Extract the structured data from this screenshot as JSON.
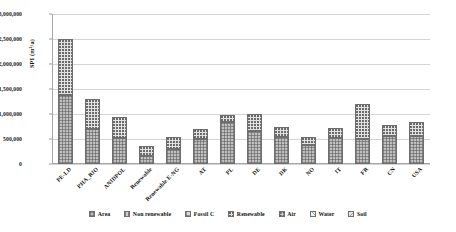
{
  "chart_data": {
    "type": "bar",
    "subtype": "stacked-column",
    "title": "",
    "xlabel": "",
    "ylabel": "SPI (m²/a)",
    "ylim": [
      0,
      3000000
    ],
    "ytick_step": 500000,
    "ytick_labels": [
      "3,000,000",
      "2,500,000",
      "2,000,000",
      "1,500,000",
      "1,000,000",
      "500,000",
      "0"
    ],
    "ytick_values": [
      3000000,
      2500000,
      2000000,
      1500000,
      1000000,
      500000,
      0
    ],
    "grid": "horizontal",
    "legend_position": "bottom",
    "categories": [
      "PE-LD",
      "PHA_RIO",
      "ANIDPOL",
      "Renewable",
      "Renewable E-NG",
      "AT",
      "PL",
      "DE",
      "DK",
      "NO",
      "IT",
      "FR",
      "CN",
      "USA"
    ],
    "series": [
      {
        "name": "Area",
        "pattern": "p-area",
        "color": "#bfbfbf",
        "values": [
          1380000,
          700000,
          520000,
          170000,
          300000,
          500000,
          840000,
          660000,
          540000,
          380000,
          520000,
          500000,
          560000,
          570000
        ]
      },
      {
        "name": "Non renewable",
        "pattern": "p-nonren",
        "color": "#cfcfcf",
        "values": [
          0,
          0,
          0,
          0,
          0,
          0,
          0,
          0,
          0,
          0,
          0,
          0,
          0,
          0
        ]
      },
      {
        "name": "Fossil C",
        "pattern": "p-fossil",
        "color": "#d9d9d9",
        "values": [
          0,
          0,
          0,
          0,
          0,
          0,
          0,
          0,
          0,
          0,
          0,
          0,
          0,
          0
        ]
      },
      {
        "name": "Renewable",
        "pattern": "p-renew",
        "color": "#e2e2e2",
        "values": [
          1120000,
          600000,
          430000,
          190000,
          250000,
          210000,
          140000,
          350000,
          200000,
          170000,
          200000,
          700000,
          220000,
          270000
        ]
      },
      {
        "name": "Air",
        "pattern": "p-air",
        "color": "#ededed",
        "values": [
          0,
          0,
          0,
          0,
          0,
          0,
          0,
          0,
          0,
          0,
          0,
          0,
          0,
          0
        ]
      },
      {
        "name": "Water",
        "pattern": "p-water",
        "color": "#f2f2f2",
        "values": [
          0,
          0,
          0,
          0,
          0,
          0,
          0,
          0,
          0,
          0,
          0,
          0,
          0,
          0
        ]
      },
      {
        "name": "Soil",
        "pattern": "p-soil",
        "color": "#e8e8e8",
        "values": [
          0,
          0,
          0,
          0,
          0,
          0,
          0,
          0,
          0,
          0,
          0,
          0,
          0,
          0
        ]
      }
    ],
    "totals": [
      2500000,
      1300000,
      950000,
      360000,
      550000,
      710000,
      980000,
      1010000,
      740000,
      550000,
      720000,
      1200000,
      780000,
      840000
    ]
  },
  "legend": {
    "items": [
      {
        "label": "Area"
      },
      {
        "label": "Non renewable"
      },
      {
        "label": "Fossil C"
      },
      {
        "label": "Renewable"
      },
      {
        "label": "Air"
      },
      {
        "label": "Water"
      },
      {
        "label": "Soil"
      }
    ]
  }
}
